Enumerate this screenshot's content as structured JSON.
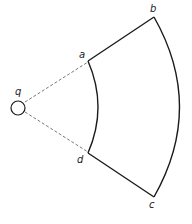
{
  "diagram": {
    "type": "sector-loop",
    "charge": {
      "label": "q"
    },
    "points": {
      "a": "a",
      "b": "b",
      "c": "c",
      "d": "d"
    },
    "colors": {
      "line": "#1a1a1a",
      "dashed": "#555555"
    }
  }
}
